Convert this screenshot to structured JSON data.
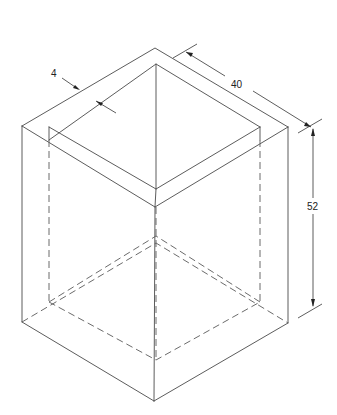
{
  "figure": {
    "type": "isometric-drawing",
    "line_color": "#4a4a4a",
    "dimensions": {
      "wall_thickness": {
        "label": "4"
      },
      "width": {
        "label": "40"
      },
      "height": {
        "label": "52"
      }
    }
  }
}
